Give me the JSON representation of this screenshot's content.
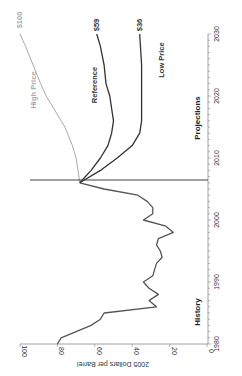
{
  "chart_data": {
    "type": "line",
    "orientation": "rotated-90-clockwise",
    "title": "",
    "xlabel": "",
    "ylabel": "2005 Dollars per Barrel",
    "xlim": [
      1980,
      2030
    ],
    "ylim": [
      0,
      100
    ],
    "x_ticks": [
      "1980",
      "1990",
      "2000",
      "2010",
      "2020",
      "2030"
    ],
    "y_ticks": [
      "0",
      "20",
      "40",
      "60",
      "80",
      "100"
    ],
    "grid": false,
    "annotations": [
      "History",
      "Projections"
    ],
    "divider_year": 2006,
    "series": [
      {
        "name": "History",
        "color": "#555555",
        "x": [
          1980,
          1981,
          1982,
          1983,
          1984,
          1985,
          1986,
          1987,
          1988,
          1989,
          1990,
          1991,
          1992,
          1993,
          1994,
          1995,
          1996,
          1997,
          1998,
          1999,
          2000,
          2001,
          2002,
          2003,
          2004,
          2005,
          2006
        ],
        "values": [
          80,
          78,
          70,
          62,
          57,
          55,
          27,
          31,
          26,
          31,
          34,
          29,
          28,
          27,
          24,
          25,
          27,
          26,
          18,
          22,
          34,
          29,
          29,
          32,
          37,
          55,
          68
        ]
      },
      {
        "name": "High Price",
        "end_label": "$100",
        "color": "#aaaaaa",
        "x": [
          2006,
          2008,
          2010,
          2012,
          2015,
          2018,
          2020,
          2022,
          2025,
          2028,
          2030
        ],
        "values": [
          68,
          69,
          70,
          72,
          76,
          82,
          86,
          89,
          93,
          97,
          100
        ]
      },
      {
        "name": "Reference",
        "end_label": "$59",
        "color": "#333333",
        "x": [
          2006,
          2008,
          2010,
          2012,
          2014,
          2016,
          2018,
          2020,
          2022,
          2025,
          2028,
          2030
        ],
        "values": [
          68,
          62,
          57,
          53,
          51,
          50,
          51,
          52,
          54,
          55,
          57,
          59
        ]
      },
      {
        "name": "Low Price",
        "end_label": "$36",
        "color": "#333333",
        "x": [
          2006,
          2008,
          2010,
          2012,
          2014,
          2016,
          2020,
          2025,
          2030
        ],
        "values": [
          68,
          57,
          48,
          40,
          36,
          35,
          35,
          35,
          36
        ]
      }
    ]
  },
  "labels": {
    "y_axis_title": "2005 Dollars per Barrel",
    "history": "History",
    "projections": "Projections",
    "high_price": "High Price",
    "reference": "Reference",
    "low_price": "Low Price",
    "high_end": "$100",
    "reference_end": "$59",
    "low_end": "$36",
    "x_ticks": [
      "1980",
      "1990",
      "2000",
      "2010",
      "2020",
      "2030"
    ],
    "y_ticks": [
      "0",
      "20",
      "40",
      "60",
      "80",
      "100"
    ]
  }
}
